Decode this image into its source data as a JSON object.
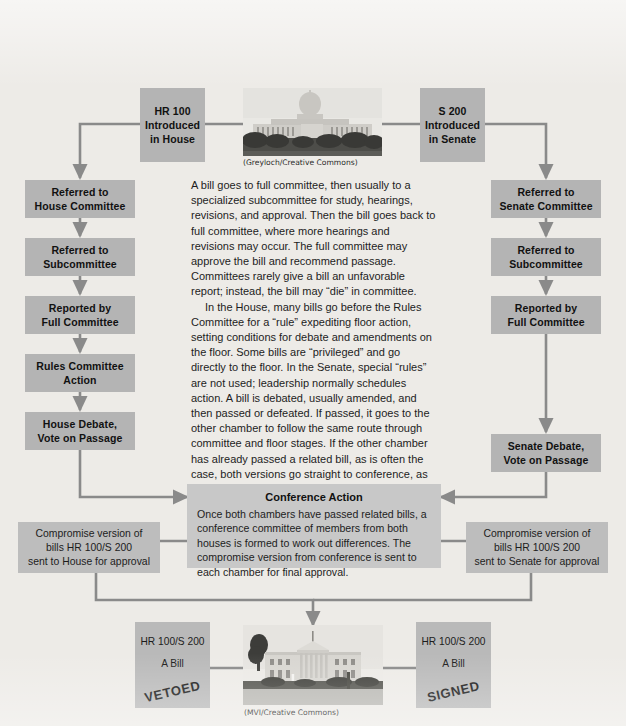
{
  "theme": {
    "background": "#edebe7",
    "box_fill": "#b4b4b4",
    "panel_fill": "#c8c8c8",
    "arrow_color": "#8a8a8a",
    "text_color": "#1a1a1a"
  },
  "house_track": {
    "intro": "HR 100\nIntroduced\nin House",
    "steps": [
      "Referred to\nHouse Committee",
      "Referred to\nSubcommittee",
      "Reported by\nFull Committee",
      "Rules Committee\nAction",
      "House Debate,\nVote on Passage"
    ]
  },
  "senate_track": {
    "intro": "S 200\nIntroduced\nin Senate",
    "steps": [
      "Referred to\nSenate Committee",
      "Referred to\nSubcommittee",
      "Reported by\nFull Committee",
      "Senate Debate,\nVote on Passage"
    ]
  },
  "narrative": {
    "paragraph_1": "A bill goes to full committee, then usually to a specialized subcommittee for study, hearings, revisions, and approval. Then the bill goes back to full committee, where more hearings and revisions may occur. The full committee may approve the bill and recommend passage. Committees rarely give a bill an unfavorable report; instead, the bill may “die” in committee.",
    "paragraph_2": "In the House, many bills go before the Rules Committee for a “rule” expediting floor action, setting conditions for debate and amendments on the floor. Some bills are “privileged” and go directly to the floor. In the Senate, special “rules” are not used; leadership normally schedules action. A bill is debated, usually amended, and then passed or defeated. If passed, it goes to the other chamber to follow the same route through committee and floor stages. If the other chamber has already passed a related bill, as is often the case, both versions go straight to conference, as shown in this figure."
  },
  "conference": {
    "title": "Conference Action",
    "body": "Once both chambers have passed related bills, a conference committee of members from both houses is formed to work out differences. The compromise version from conference is sent to each chamber for final approval."
  },
  "compromise": {
    "house": "Compromise version of\nbills HR 100/S 200\nsent to House for approval",
    "senate": "Compromise version of\nbills HR 100/S 200\nsent to Senate for approval"
  },
  "outcomes": {
    "vetoed": {
      "line1": "HR 100/S 200",
      "line2": "A Bill",
      "stamp": "VETOED"
    },
    "signed": {
      "line1": "HR 100/S 200",
      "line2": "A Bill",
      "stamp": "SIGNED"
    }
  },
  "photos": {
    "capitol_credit": "(Greyloch/Creative Commons)",
    "whitehouse_credit": "(MVI/Creative Commons)",
    "capitol_alt": "capitol-building-photo",
    "whitehouse_alt": "white-house-photo"
  }
}
